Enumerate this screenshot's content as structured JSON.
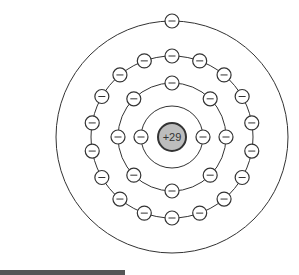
{
  "diagram": {
    "type": "bohr-model",
    "nucleus": {
      "label": "+29",
      "fill": "#bdbdbd",
      "stroke": "#333333"
    },
    "electron_label": "−",
    "shells": [
      {
        "radius": 31,
        "electrons": 2,
        "offset_deg": 0
      },
      {
        "radius": 54,
        "electrons": 8,
        "offset_deg": 0
      },
      {
        "radius": 81,
        "electrons": 18,
        "offset_deg": 10
      },
      {
        "radius": 116,
        "electrons": 1,
        "offset_deg": -90
      }
    ],
    "center": {
      "x": 172,
      "y": 137
    }
  }
}
